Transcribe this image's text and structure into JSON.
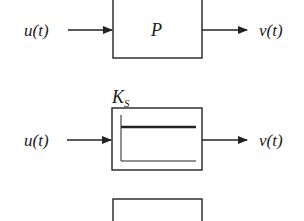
{
  "diagram": {
    "type": "block-diagram",
    "rows": [
      {
        "input_label": "u(t)",
        "output_label": "v(t)",
        "block": {
          "kind": "plain",
          "label": "P"
        }
      },
      {
        "input_label": "u(t)",
        "output_label": "v(t)",
        "block": {
          "kind": "static-gain",
          "title_main": "K",
          "title_sub": "S",
          "icon": "step-response-flat-line"
        }
      },
      {
        "block": {
          "kind": "plain-partial"
        }
      }
    ],
    "colors": {
      "stroke": "#222222",
      "background": "#ffffff"
    }
  }
}
